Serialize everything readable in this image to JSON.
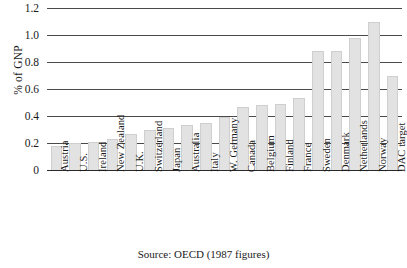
{
  "chart_data": {
    "type": "bar",
    "title": "",
    "xlabel": "",
    "ylabel": "% of GNP",
    "ylim": [
      0,
      1.2
    ],
    "ytick_labels": [
      "1.2",
      "1.0",
      "0.8",
      "0.6",
      "0.4",
      "0.2",
      "0"
    ],
    "ytick_values": [
      1.2,
      1.0,
      0.8,
      0.6,
      0.4,
      0.2,
      0
    ],
    "grid": true,
    "legend": "none",
    "bar_color": "#e2e2e2",
    "bar_edge_color": "#cfcfcf",
    "axis_color": "#4a4a4a",
    "categories": [
      "Austria",
      "U.S.",
      "Ireland",
      "New Zealand",
      "U.K.",
      "Switzerland",
      "Japan",
      "Australia",
      "Italy",
      "W. Germany",
      "Canada",
      "Belgium",
      "Finland",
      "France",
      "Sweden",
      "Denmark",
      "Netherlands",
      "Norway",
      "DAC target"
    ],
    "values": [
      0.18,
      0.2,
      0.21,
      0.23,
      0.27,
      0.3,
      0.31,
      0.33,
      0.35,
      0.39,
      0.47,
      0.48,
      0.49,
      0.53,
      0.88,
      0.88,
      0.98,
      1.1,
      0.7
    ],
    "annotations": []
  },
  "caption": {
    "source_text": "Source: OECD (1987 figures)"
  }
}
